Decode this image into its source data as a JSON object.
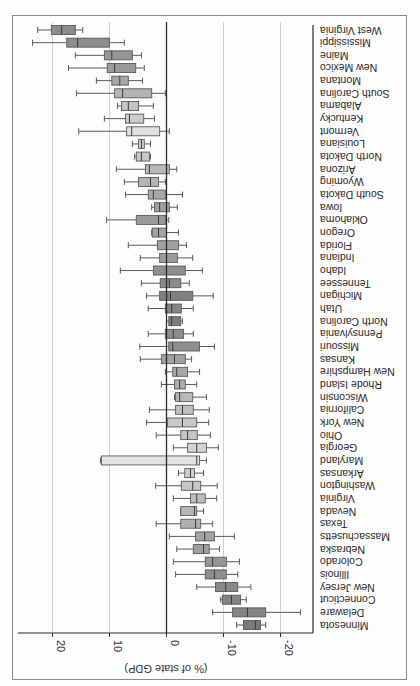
{
  "chart_data": {
    "type": "boxplot",
    "orientation": "horizontal, image rotated 180 degrees",
    "title": "",
    "xlabel": "(% of state GDP)",
    "ylabel": "",
    "xlim": [
      -25,
      26
    ],
    "x_ticks": [
      20,
      10,
      0,
      -10,
      -20
    ],
    "x_tick_labels": [
      "20",
      "10",
      "0",
      "-10",
      "-20"
    ],
    "grid": "vertical gridlines at ticks",
    "reference_line": 0,
    "legend": "none",
    "series": [
      {
        "state": "West Virginia",
        "whisker_low": 14.7,
        "q1": 16.0,
        "median": 18.4,
        "q3": 20.2,
        "whisker_high": 22.6,
        "shade": "#8c8c8c"
      },
      {
        "state": "Mississippi",
        "whisker_low": 7.4,
        "q1": 10.0,
        "median": 15.6,
        "q3": 17.5,
        "whisker_high": 23.5,
        "shade": "#8c8c8c"
      },
      {
        "state": "Maine",
        "whisker_low": 4.4,
        "q1": 6.0,
        "median": 9.6,
        "q3": 10.9,
        "whisker_high": 16.0,
        "shade": "#959595"
      },
      {
        "state": "New Mexico",
        "whisker_low": 3.9,
        "q1": 5.4,
        "median": 9.1,
        "q3": 10.4,
        "whisker_high": 17.2,
        "shade": "#9a9a9a"
      },
      {
        "state": "Montana",
        "whisker_low": 4.2,
        "q1": 6.7,
        "median": 8.2,
        "q3": 9.6,
        "whisker_high": 12.3,
        "shade": "#a6a6a6"
      },
      {
        "state": "South Carolina",
        "whisker_low": 0.2,
        "q1": 2.6,
        "median": 7.7,
        "q3": 9.1,
        "whisker_high": 15.8,
        "shade": "#b3b3b3"
      },
      {
        "state": "Alabama",
        "whisker_low": 2.3,
        "q1": 4.9,
        "median": 6.7,
        "q3": 7.9,
        "whisker_high": 8.6,
        "shade": "#c4c4c4"
      },
      {
        "state": "Kentucky",
        "whisker_low": 2.1,
        "q1": 4.0,
        "median": 6.5,
        "q3": 7.2,
        "whisker_high": 10.9,
        "shade": "#cccccc"
      },
      {
        "state": "Vermont",
        "whisker_low": -0.5,
        "q1": 1.2,
        "median": 6.1,
        "q3": 7.0,
        "whisker_high": 15.4,
        "shade": "#e0e0e0"
      },
      {
        "state": "Louisiana",
        "whisker_low": 2.8,
        "q1": 3.9,
        "median": 4.4,
        "q3": 4.9,
        "whisker_high": 6.0,
        "shade": "#d2d2d2"
      },
      {
        "state": "North Dakota",
        "whisker_low": 2.8,
        "q1": 3.0,
        "median": 4.4,
        "q3": 5.3,
        "whisker_high": 5.6,
        "shade": "#c8c8c8"
      },
      {
        "state": "Arizona",
        "whisker_low": -1.8,
        "q1": -0.5,
        "median": 3.0,
        "q3": 3.7,
        "whisker_high": 8.8,
        "shade": "#b8b8b8"
      },
      {
        "state": "Wyoming",
        "whisker_low": 0.2,
        "q1": 1.4,
        "median": 2.8,
        "q3": 4.9,
        "whisker_high": 7.4,
        "shade": "#b3b3b3"
      },
      {
        "state": "South Dakota",
        "whisker_low": -2.8,
        "q1": 0.2,
        "median": 2.3,
        "q3": 3.2,
        "whisker_high": 7.2,
        "shade": "#a8a8a8"
      },
      {
        "state": "Iowa",
        "whisker_low": -1.9,
        "q1": -0.5,
        "median": 1.2,
        "q3": 2.1,
        "whisker_high": 2.6,
        "shade": "#a0a0a0"
      },
      {
        "state": "Oklahoma",
        "whisker_low": -0.4,
        "q1": 0.2,
        "median": 1.4,
        "q3": 5.3,
        "whisker_high": 10.5,
        "shade": "#9a9a9a"
      },
      {
        "state": "Oregon",
        "whisker_low": -2.1,
        "q1": 0.0,
        "median": 1.4,
        "q3": 2.5,
        "whisker_high": 2.6,
        "shade": "#a3a3a3"
      },
      {
        "state": "Florida",
        "whisker_low": -3.5,
        "q1": -2.1,
        "median": 0.0,
        "q3": 1.6,
        "whisker_high": 6.7,
        "shade": "#a0a0a0"
      },
      {
        "state": "Indiana",
        "whisker_low": -4.6,
        "q1": -1.9,
        "median": 0.0,
        "q3": 1.2,
        "whisker_high": 4.6,
        "shade": "#9c9c9c"
      },
      {
        "state": "Idaho",
        "whisker_low": -6.3,
        "q1": -3.3,
        "median": 0.0,
        "q3": 2.3,
        "whisker_high": 8.1,
        "shade": "#8e8e8e"
      },
      {
        "state": "Tennessee",
        "whisker_low": -4.0,
        "q1": -2.5,
        "median": -0.5,
        "q3": 1.1,
        "whisker_high": 4.4,
        "shade": "#8a8a8a"
      },
      {
        "state": "Michigan",
        "whisker_low": -8.2,
        "q1": -4.6,
        "median": -0.7,
        "q3": 1.2,
        "whisker_high": 3.5,
        "shade": "#808080"
      },
      {
        "state": "Utah",
        "whisker_low": -4.7,
        "q1": -2.6,
        "median": -0.9,
        "q3": 0.2,
        "whisker_high": 3.2,
        "shade": "#858585"
      },
      {
        "state": "North Carolina",
        "whisker_low": -2.8,
        "q1": -2.5,
        "median": -0.9,
        "q3": -0.4,
        "whisker_high": 0.0,
        "shade": "#7c7c7c"
      },
      {
        "state": "Pennsylvania",
        "whisker_low": -4.7,
        "q1": -3.0,
        "median": -1.2,
        "q3": 0.2,
        "whisker_high": 3.2,
        "shade": "#8c8c8c"
      },
      {
        "state": "Missouri",
        "whisker_low": -8.4,
        "q1": -5.8,
        "median": -1.1,
        "q3": -0.4,
        "whisker_high": 4.7,
        "shade": "#8e8e8e"
      },
      {
        "state": "Kansas",
        "whisker_low": -4.4,
        "q1": -3.3,
        "median": -1.4,
        "q3": 0.9,
        "whisker_high": 4.6,
        "shade": "#a0a0a0"
      },
      {
        "state": "New Hampshire",
        "whisker_low": -5.8,
        "q1": -3.7,
        "median": -1.8,
        "q3": -1.1,
        "whisker_high": 0.2,
        "shade": "#a6a6a6"
      },
      {
        "state": "Rhode Island",
        "whisker_low": -5.3,
        "q1": -3.3,
        "median": -2.3,
        "q3": -1.4,
        "whisker_high": 0.9,
        "shade": "#acacac"
      },
      {
        "state": "Wisconsin",
        "whisker_low": -7.0,
        "q1": -4.6,
        "median": -2.3,
        "q3": -1.6,
        "whisker_high": -1.4,
        "shade": "#b8b8b8"
      },
      {
        "state": "California",
        "whisker_low": -7.5,
        "q1": -4.7,
        "median": -2.8,
        "q3": -1.6,
        "whisker_high": 3.0,
        "shade": "#c0c0c0"
      },
      {
        "state": "New York",
        "whisker_low": -7.4,
        "q1": -5.3,
        "median": -2.8,
        "q3": -0.2,
        "whisker_high": 3.5,
        "shade": "#c8c8c8"
      },
      {
        "state": "Ohio",
        "whisker_low": -7.7,
        "q1": -5.4,
        "median": -3.7,
        "q3": -2.5,
        "whisker_high": 1.8,
        "shade": "#c4c4c4"
      },
      {
        "state": "Georgia",
        "whisker_low": -9.1,
        "q1": -7.0,
        "median": -5.3,
        "q3": -3.7,
        "whisker_high": -1.2,
        "shade": "#d2d2d2"
      },
      {
        "state": "Maryland",
        "whisker_low": -7.0,
        "q1": -5.8,
        "median": -5.3,
        "q3": 11.4,
        "whisker_high": 11.6,
        "shade": "#e2e2e2"
      },
      {
        "state": "Arkansas",
        "whisker_low": -6.5,
        "q1": -4.9,
        "median": -4.2,
        "q3": -3.2,
        "whisker_high": -2.1,
        "shade": "#cfcfcf"
      },
      {
        "state": "Washington",
        "whisker_low": -8.9,
        "q1": -6.0,
        "median": -4.6,
        "q3": -2.6,
        "whisker_high": 1.9,
        "shade": "#c6c6c6"
      },
      {
        "state": "Virginia",
        "whisker_low": -8.8,
        "q1": -6.8,
        "median": -5.3,
        "q3": -4.2,
        "whisker_high": -1.2,
        "shade": "#bdbdbd"
      },
      {
        "state": "Nevada",
        "whisker_low": -6.5,
        "q1": -5.3,
        "median": -4.9,
        "q3": -2.5,
        "whisker_high": -2.5,
        "shade": "#b5b5b5"
      },
      {
        "state": "Texas",
        "whisker_low": -8.1,
        "q1": -6.0,
        "median": -5.1,
        "q3": -2.5,
        "whisker_high": 1.8,
        "shade": "#b0b0b0"
      },
      {
        "state": "Massachusetts",
        "whisker_low": -11.9,
        "q1": -8.4,
        "median": -6.7,
        "q3": -5.1,
        "whisker_high": -0.5,
        "shade": "#a3a3a3"
      },
      {
        "state": "Nebraska",
        "whisker_low": -9.3,
        "q1": -7.5,
        "median": -6.5,
        "q3": -4.7,
        "whisker_high": -1.8,
        "shade": "#9e9e9e"
      },
      {
        "state": "Colorado",
        "whisker_low": -12.8,
        "q1": -10.5,
        "median": -8.1,
        "q3": -6.8,
        "whisker_high": -1.2,
        "shade": "#959595"
      },
      {
        "state": "Illinois",
        "whisker_low": -12.5,
        "q1": -10.5,
        "median": -8.4,
        "q3": -6.8,
        "whisker_high": -1.6,
        "shade": "#8e8e8e"
      },
      {
        "state": "New Jersey",
        "whisker_low": -14.8,
        "q1": -12.5,
        "median": -10.4,
        "q3": -8.6,
        "whisker_high": -5.3,
        "shade": "#8a8a8a"
      },
      {
        "state": "Connecticut",
        "whisker_low": -14.0,
        "q1": -13.0,
        "median": -11.4,
        "q3": -9.8,
        "whisker_high": -9.5,
        "shade": "#848484"
      },
      {
        "state": "Delaware",
        "whisker_low": -23.5,
        "q1": -17.4,
        "median": -14.2,
        "q3": -11.6,
        "whisker_high": -8.1,
        "shade": "#858585"
      },
      {
        "state": "Minnesota",
        "whisker_low": -17.4,
        "q1": -16.5,
        "median": -15.6,
        "q3": -13.5,
        "whisker_high": -12.3,
        "shade": "#7a7a7a"
      }
    ]
  }
}
